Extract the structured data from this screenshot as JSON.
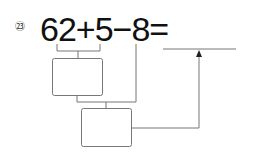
{
  "problem": {
    "number_label": "㉓",
    "expression": "62+5−8=",
    "answer_value": "",
    "boxes": [
      {
        "id": "step1",
        "value": ""
      },
      {
        "id": "step2",
        "value": ""
      }
    ],
    "colors": {
      "text": "#111111",
      "lines": "#666666"
    }
  }
}
